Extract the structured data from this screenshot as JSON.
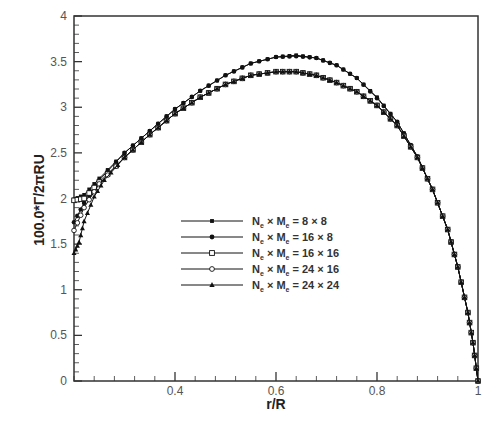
{
  "chart_data": {
    "type": "line",
    "title": "",
    "xlabel": "r/R",
    "ylabel": "100.0*Γ/2πRU",
    "xlim": [
      0.2,
      1.0
    ],
    "ylim": [
      0,
      4
    ],
    "xticks": [
      0.4,
      0.6,
      0.8,
      1.0
    ],
    "xtick_labels": [
      "0.4",
      "0.6",
      "0.8",
      "1"
    ],
    "yticks": [
      0,
      0.5,
      1,
      1.5,
      2,
      2.5,
      3,
      3.5,
      4
    ],
    "ytick_labels": [
      "0",
      "0.5",
      "1",
      "1.5",
      "2",
      "2.5",
      "3",
      "3.5",
      "4"
    ],
    "grid": false,
    "legend_position": "center-left inside plot",
    "series": [
      {
        "name": "Nₑ × Mₑ = 8 × 8",
        "label_parts": [
          "N",
          "e",
          " × M",
          "e",
          " =  8 × 8"
        ],
        "marker": "small-filled-square",
        "x": [
          0.2,
          0.22,
          0.25,
          0.3,
          0.35,
          0.4,
          0.45,
          0.5,
          0.55,
          0.6,
          0.64,
          0.68,
          0.72,
          0.76,
          0.8,
          0.84,
          0.88,
          0.91,
          0.94,
          0.96,
          0.98,
          0.99,
          1.0
        ],
        "values": [
          1.99,
          2.04,
          2.22,
          2.5,
          2.74,
          2.98,
          3.18,
          3.35,
          3.48,
          3.55,
          3.57,
          3.54,
          3.46,
          3.32,
          3.11,
          2.84,
          2.46,
          2.1,
          1.66,
          1.25,
          0.75,
          0.42,
          0.0
        ]
      },
      {
        "name": "Nₑ × Mₑ = 16 × 8",
        "label_parts": [
          "N",
          "e",
          " × M",
          "e",
          " = 16 × 8"
        ],
        "marker": "filled-circle",
        "x": [
          0.2,
          0.22,
          0.25,
          0.3,
          0.35,
          0.4,
          0.45,
          0.5,
          0.55,
          0.6,
          0.64,
          0.68,
          0.72,
          0.76,
          0.8,
          0.84,
          0.88,
          0.91,
          0.94,
          0.96,
          0.98,
          0.99,
          1.0
        ],
        "values": [
          1.74,
          1.95,
          2.2,
          2.5,
          2.74,
          2.98,
          3.18,
          3.35,
          3.48,
          3.55,
          3.56,
          3.54,
          3.46,
          3.32,
          3.1,
          2.84,
          2.46,
          2.1,
          1.66,
          1.25,
          0.75,
          0.42,
          0.0
        ]
      },
      {
        "name": "Nₑ × Mₑ = 16 × 16",
        "label_parts": [
          "N",
          "e",
          " × M",
          "e",
          " = 16 × 16"
        ],
        "marker": "open-square",
        "x": [
          0.2,
          0.22,
          0.25,
          0.3,
          0.35,
          0.4,
          0.45,
          0.5,
          0.55,
          0.6,
          0.64,
          0.68,
          0.72,
          0.76,
          0.8,
          0.84,
          0.88,
          0.91,
          0.94,
          0.96,
          0.98,
          0.99,
          1.0
        ],
        "values": [
          1.98,
          2.0,
          2.18,
          2.45,
          2.7,
          2.93,
          3.11,
          3.25,
          3.35,
          3.39,
          3.39,
          3.35,
          3.27,
          3.17,
          3.02,
          2.8,
          2.45,
          2.1,
          1.66,
          1.25,
          0.75,
          0.42,
          0.0
        ]
      },
      {
        "name": "Nₑ × Mₑ = 24 × 16",
        "label_parts": [
          "N",
          "e",
          " × M",
          "e",
          " = 24 × 16"
        ],
        "marker": "open-circle",
        "x": [
          0.2,
          0.22,
          0.25,
          0.3,
          0.35,
          0.4,
          0.45,
          0.5,
          0.55,
          0.6,
          0.64,
          0.68,
          0.72,
          0.76,
          0.8,
          0.84,
          0.88,
          0.91,
          0.94,
          0.96,
          0.98,
          0.99,
          1.0
        ],
        "values": [
          1.65,
          1.9,
          2.16,
          2.45,
          2.7,
          2.93,
          3.11,
          3.25,
          3.35,
          3.39,
          3.39,
          3.35,
          3.27,
          3.17,
          3.02,
          2.8,
          2.45,
          2.1,
          1.66,
          1.25,
          0.75,
          0.42,
          0.0
        ]
      },
      {
        "name": "Nₑ × Mₑ = 24 × 24",
        "label_parts": [
          "N",
          "e",
          " × M",
          "e",
          " = 24 × 24"
        ],
        "marker": "filled-triangle",
        "x": [
          0.2,
          0.21,
          0.22,
          0.24,
          0.26,
          0.3,
          0.35,
          0.4,
          0.45,
          0.5,
          0.55,
          0.6,
          0.64,
          0.68,
          0.72,
          0.76,
          0.8,
          0.84,
          0.88,
          0.91,
          0.94,
          0.96,
          0.98,
          0.99,
          1.0
        ],
        "values": [
          1.4,
          1.52,
          1.75,
          2.02,
          2.2,
          2.45,
          2.7,
          2.93,
          3.11,
          3.25,
          3.35,
          3.39,
          3.39,
          3.35,
          3.27,
          3.17,
          3.02,
          2.8,
          2.45,
          2.1,
          1.66,
          1.25,
          0.75,
          0.42,
          0.0
        ]
      }
    ]
  },
  "colors": {
    "axis": "#333333",
    "series": "#111111",
    "tick_label": "#555555"
  }
}
